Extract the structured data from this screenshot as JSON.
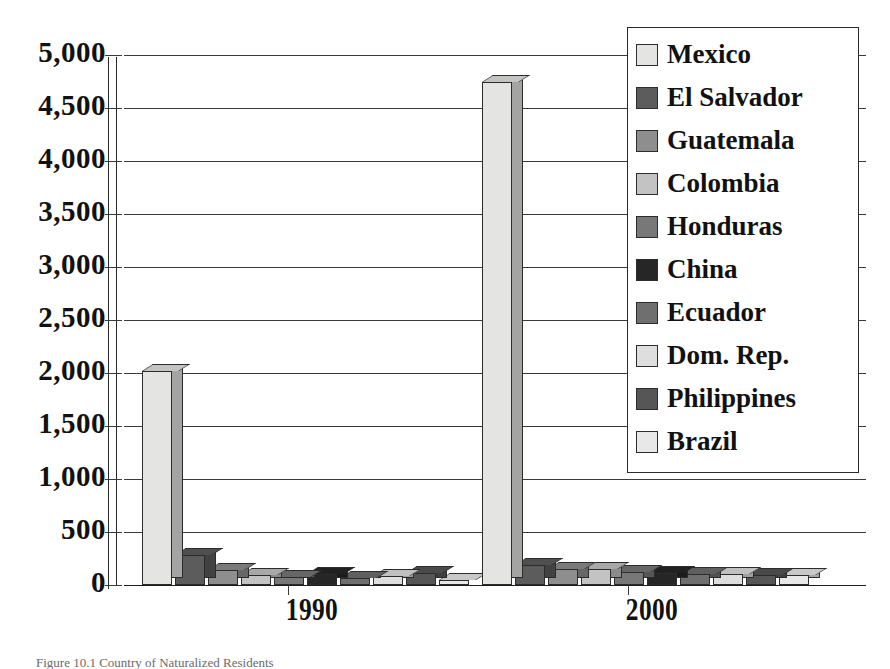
{
  "chart_data": {
    "type": "bar",
    "title": "",
    "subtitle": "",
    "xlabel": "",
    "ylabel": "",
    "categories": [
      "1990",
      "2000"
    ],
    "ylim": [
      0,
      5000
    ],
    "yticks": [
      0,
      500,
      1000,
      1500,
      2000,
      2500,
      3000,
      3500,
      4000,
      4500,
      5000
    ],
    "ytick_labels": [
      "0",
      "500",
      "1,000",
      "1,500",
      "2,000",
      "2,500",
      "3,000",
      "3,500",
      "4,000",
      "4,500",
      "5,000"
    ],
    "grid": true,
    "legend_position": "top-right",
    "style": "3d-clustered-column",
    "series": [
      {
        "name": "Mexico",
        "color": "#e4e4e2",
        "values": [
          2020,
          4750
        ]
      },
      {
        "name": "El Salvador",
        "color": "#5c5c5c",
        "values": [
          280,
          190
        ]
      },
      {
        "name": "Guatemala",
        "color": "#8e8e8e",
        "values": [
          140,
          150
        ]
      },
      {
        "name": "Colombia",
        "color": "#c3c3c3",
        "values": [
          90,
          155
        ]
      },
      {
        "name": "Honduras",
        "color": "#787878",
        "values": [
          75,
          120
        ]
      },
      {
        "name": "China",
        "color": "#262626",
        "values": [
          105,
          110
        ]
      },
      {
        "name": "Ecuador",
        "color": "#6f6f6f",
        "values": [
          70,
          105
        ]
      },
      {
        "name": "Dom. Rep.",
        "color": "#dedede",
        "values": [
          85,
          100
        ]
      },
      {
        "name": "Philippines",
        "color": "#565656",
        "values": [
          110,
          95
        ]
      },
      {
        "name": "Brazil",
        "color": "#e8e8e8",
        "values": [
          45,
          90
        ]
      }
    ],
    "annotations": []
  },
  "legend": {
    "items": [
      {
        "label": "Mexico",
        "swatch": "#e4e4e2"
      },
      {
        "label": "El Salvador",
        "swatch": "#5c5c5c"
      },
      {
        "label": "Guatemala",
        "swatch": "#8e8e8e"
      },
      {
        "label": "Colombia",
        "swatch": "#c3c3c3"
      },
      {
        "label": "Honduras",
        "swatch": "#787878"
      },
      {
        "label": "China",
        "swatch": "#262626"
      },
      {
        "label": "Ecuador",
        "swatch": "#6f6f6f"
      },
      {
        "label": "Dom. Rep.",
        "swatch": "#dedede"
      },
      {
        "label": "Philippines",
        "swatch": "#565656"
      },
      {
        "label": "Brazil",
        "swatch": "#e8e8e8"
      }
    ]
  },
  "caption": {
    "text": "Figure 10.1   Country of Naturalized Residents"
  }
}
